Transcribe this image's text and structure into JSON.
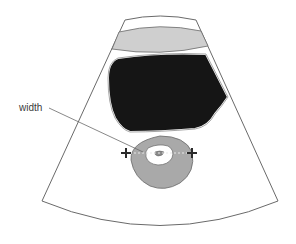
{
  "diagram": {
    "type": "ultrasound-schematic",
    "annotation": {
      "label": "width"
    },
    "colors": {
      "background": "#ffffff",
      "outline": "#6a6a6a",
      "band": "#cfcfcf",
      "dark_region": "#151515",
      "structure": "#a9a9a9",
      "lumen": "#ffffff",
      "marker": "#2a2a2a",
      "dashed_line": "#e8e8e8"
    },
    "markers": [
      {
        "name": "left-caliper",
        "symbol": "+"
      },
      {
        "name": "right-caliper",
        "symbol": "+"
      }
    ]
  }
}
